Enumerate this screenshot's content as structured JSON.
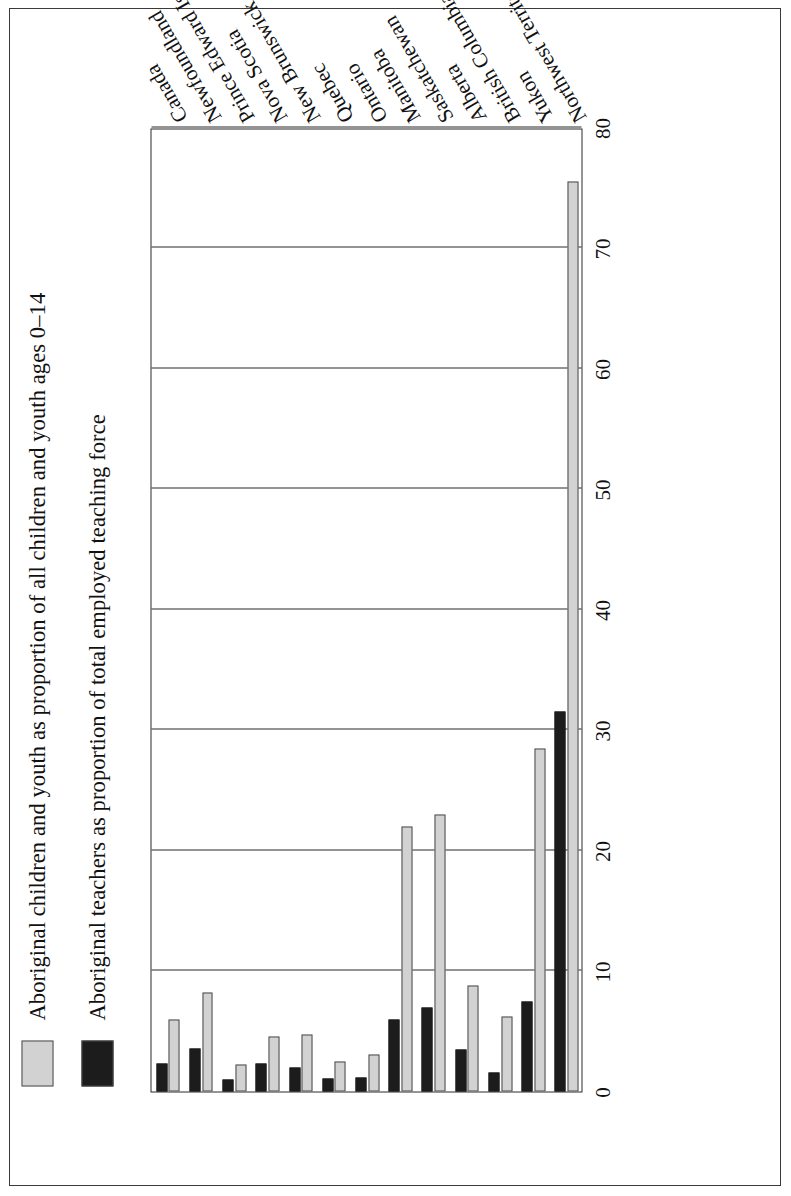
{
  "legend": {
    "items": [
      {
        "swatch": "grey-swatch",
        "label": "Aboriginal children and youth as proportion of all children and youth ages 0–14"
      },
      {
        "swatch": "black-swatch",
        "label": "Aboriginal teachers as proportion of total employed teaching force"
      }
    ]
  },
  "axis": {
    "ticks": [
      "0",
      "10",
      "20",
      "30",
      "40",
      "50",
      "60",
      "70",
      "80"
    ]
  },
  "chart_data": {
    "type": "bar",
    "orientation": "horizontal",
    "title": "",
    "xlabel": "",
    "ylabel": "",
    "xlim": [
      0,
      80
    ],
    "grid": true,
    "legend_position": "top-left",
    "categories": [
      "Canada",
      "Newfoundland",
      "Prince Edward Island",
      "Nova Scotia",
      "New Brunswick",
      "Quebec",
      "Ontario",
      "Manitoba",
      "Saskatchewan",
      "Alberta",
      "British Columbia",
      "Yukon",
      "Northwest Territories"
    ],
    "series": [
      {
        "name": "Aboriginal children and youth as proportion of all children and youth ages 0–14",
        "color": "#d2d2d2",
        "values": [
          6.0,
          8.2,
          2.2,
          4.6,
          4.7,
          2.5,
          3.1,
          22.0,
          23.0,
          8.8,
          6.2,
          28.5,
          75.5
        ]
      },
      {
        "name": "Aboriginal teachers as proportion of total employed teaching force",
        "color": "#1c1c1c",
        "values": [
          2.3,
          3.6,
          1.0,
          2.3,
          2.0,
          1.1,
          1.2,
          6.0,
          7.0,
          3.5,
          1.6,
          7.5,
          31.5
        ]
      }
    ]
  }
}
